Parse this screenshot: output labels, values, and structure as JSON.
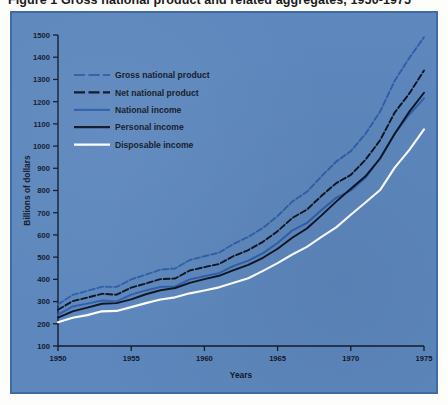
{
  "figure": {
    "title": "Figure 1  Gross national product and related aggregates, 1950-1975",
    "panel_color": "#5d87bd",
    "panel_border_color": "#3f6ba7",
    "page_color": "#fdfdfb"
  },
  "axes": {
    "x_title": "Years",
    "y_title": "Billions of dollars",
    "x_ticks": [
      "1950",
      "1955",
      "1960",
      "1965",
      "1970",
      "1975"
    ],
    "x_tick_values": [
      1950,
      1955,
      1960,
      1965,
      1970,
      1975
    ],
    "y_ticks": [
      "100",
      "200",
      "300",
      "400",
      "500",
      "600",
      "700",
      "800",
      "900",
      "1000",
      "1100",
      "1200",
      "1300",
      "1400",
      "1500"
    ],
    "y_tick_values": [
      100,
      200,
      300,
      400,
      500,
      600,
      700,
      800,
      900,
      1000,
      1100,
      1200,
      1300,
      1400,
      1500
    ],
    "xlim": [
      1950,
      1975
    ],
    "ylim": [
      100,
      1500
    ],
    "grid": false,
    "axis_color": "#131b2c"
  },
  "legend": {
    "position": "upper-left-inside",
    "items": [
      {
        "label": "Gross national product",
        "color": "#2f5fa8",
        "style": "dashed"
      },
      {
        "label": "Net national product",
        "color": "#0d1424",
        "style": "dashed"
      },
      {
        "label": "National income",
        "color": "#2f5fa8",
        "style": "solid"
      },
      {
        "label": "Personal income",
        "color": "#0d1424",
        "style": "solid"
      },
      {
        "label": "Disposable income",
        "color": "#ffffff",
        "style": "solid"
      }
    ]
  },
  "chart_data": {
    "type": "line",
    "title": "Gross national product and related aggregates, 1950-1975",
    "xlabel": "Years",
    "ylabel": "Billions of dollars",
    "xlim": [
      1950,
      1975
    ],
    "ylim": [
      100,
      1500
    ],
    "grid": false,
    "legend_position": "upper-left-inside",
    "x": [
      1950,
      1951,
      1952,
      1953,
      1954,
      1955,
      1956,
      1957,
      1958,
      1959,
      1960,
      1961,
      1962,
      1963,
      1964,
      1965,
      1966,
      1967,
      1968,
      1969,
      1970,
      1971,
      1972,
      1973,
      1974,
      1975
    ],
    "series": [
      {
        "name": "Gross national product",
        "color": "#2f5fa8",
        "style": "dashed",
        "values": [
          287,
          330,
          348,
          367,
          366,
          400,
          421,
          444,
          449,
          487,
          504,
          520,
          560,
          591,
          632,
          685,
          750,
          794,
          864,
          930,
          977,
          1055,
          1155,
          1294,
          1397,
          1490
        ]
      },
      {
        "name": "Net national product",
        "color": "#0d1424",
        "style": "dashed",
        "values": [
          263,
          302,
          318,
          335,
          331,
          363,
          381,
          401,
          404,
          440,
          455,
          469,
          505,
          532,
          569,
          617,
          676,
          714,
          776,
          833,
          870,
          938,
          1026,
          1151,
          1237,
          1340
        ]
      },
      {
        "name": "National income",
        "color": "#2f5fa8",
        "style": "solid",
        "values": [
          241,
          278,
          291,
          305,
          301,
          331,
          350,
          366,
          368,
          400,
          414,
          428,
          461,
          484,
          518,
          564,
          620,
          654,
          712,
          767,
          800,
          857,
          945,
          1056,
          1142,
          1215
        ]
      },
      {
        "name": "Personal income",
        "color": "#0d1424",
        "style": "solid",
        "values": [
          228,
          256,
          273,
          290,
          293,
          310,
          333,
          351,
          361,
          384,
          401,
          416,
          442,
          465,
          497,
          538,
          587,
          629,
          688,
          750,
          808,
          864,
          944,
          1055,
          1155,
          1240
        ]
      },
      {
        "name": "Disposable income",
        "color": "#ffffff",
        "style": "solid",
        "values": [
          207,
          227,
          239,
          256,
          258,
          275,
          293,
          309,
          319,
          337,
          350,
          364,
          385,
          405,
          438,
          473,
          512,
          546,
          591,
          634,
          691,
          746,
          802,
          903,
          983,
          1075
        ]
      }
    ]
  }
}
